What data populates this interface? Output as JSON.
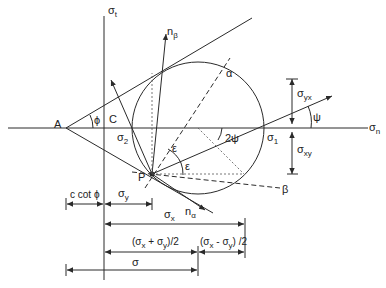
{
  "diagram": {
    "type": "mohr-coulomb-circle",
    "axes": {
      "horizontal": {
        "symbol": "σ",
        "subscript": "n"
      },
      "vertical": {
        "symbol": "σ",
        "subscript": "t"
      }
    },
    "points": {
      "A": "A",
      "C": "C",
      "P": "P"
    },
    "angles": {
      "phi": "ϕ",
      "psi": "ψ",
      "two_psi": "2ψ",
      "epsilon_upper": "ε",
      "epsilon_lower": "ε"
    },
    "circle_labels": {
      "sigma2": {
        "symbol": "σ",
        "subscript": "2"
      },
      "sigma1": {
        "symbol": "σ",
        "subscript": "1"
      },
      "alpha": "α",
      "beta": "β"
    },
    "normals": {
      "n_beta": {
        "symbol": "n",
        "subscript": "β"
      },
      "n_alpha": {
        "symbol": "n",
        "subscript": "α"
      }
    },
    "right_dimensions": {
      "sigma_yx": {
        "symbol": "σ",
        "subscript": "yx"
      },
      "sigma_xy": {
        "symbol": "σ",
        "subscript": "xy"
      }
    },
    "bottom_dimensions": {
      "c_cot_phi": "c cot ϕ",
      "sigma_y": {
        "symbol": "σ",
        "subscript": "y"
      },
      "sigma_x": {
        "symbol": "σ",
        "subscript": "x"
      },
      "mean": {
        "open": "(σ",
        "sx": "x",
        "plus": " + σ",
        "sy": "y",
        "close": ")/2"
      },
      "half_diff": {
        "open": "(σ",
        "sx": "x",
        "minus": " - σ",
        "sy": "y",
        "close": ") /2"
      },
      "sigma": "σ"
    }
  }
}
